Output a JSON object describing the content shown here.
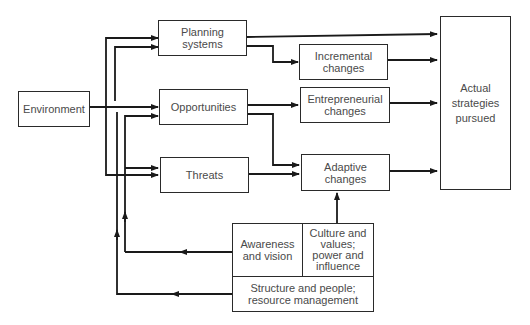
{
  "diagram": {
    "type": "flowchart",
    "nodes": {
      "environment": "Environment",
      "planning_systems": "Planning\nsystems",
      "opportunities": "Opportunities",
      "threats": "Threats",
      "incremental_changes": "Incremental\nchanges",
      "entrepreneurial_changes": "Entrepreneurial\nchanges",
      "adaptive_changes": "Adaptive\nchanges",
      "actual_strategies": "Actual\nstrategies\npursued",
      "awareness_vision": "Awareness\nand vision",
      "culture_values": "Culture and\nvalues;\npower and\ninfluence",
      "structure_people": "Structure and people;\nresource management"
    },
    "edges": [
      {
        "from": "Environment",
        "to": "Planning systems"
      },
      {
        "from": "Environment",
        "to": "Opportunities"
      },
      {
        "from": "Environment",
        "to": "Threats"
      },
      {
        "from": "Planning systems",
        "to": "Actual strategies pursued"
      },
      {
        "from": "Planning systems",
        "to": "Incremental changes"
      },
      {
        "from": "Opportunities",
        "to": "Entrepreneurial changes"
      },
      {
        "from": "Opportunities",
        "to": "Adaptive changes"
      },
      {
        "from": "Threats",
        "to": "Adaptive changes"
      },
      {
        "from": "Incremental changes",
        "to": "Actual strategies pursued"
      },
      {
        "from": "Entrepreneurial changes",
        "to": "Actual strategies pursued"
      },
      {
        "from": "Adaptive changes",
        "to": "Actual strategies pursued"
      },
      {
        "from": "Culture and values; power and influence",
        "to": "Adaptive changes"
      },
      {
        "from": "Awareness and vision",
        "to": "Planning systems / Opportunities / Threats"
      },
      {
        "from": "Structure and people; resource management",
        "to": "Planning systems / Opportunities / Threats"
      }
    ]
  },
  "colors": {
    "line": "#1a1a1a",
    "text": "#4a4a4a",
    "background": "#ffffff"
  }
}
